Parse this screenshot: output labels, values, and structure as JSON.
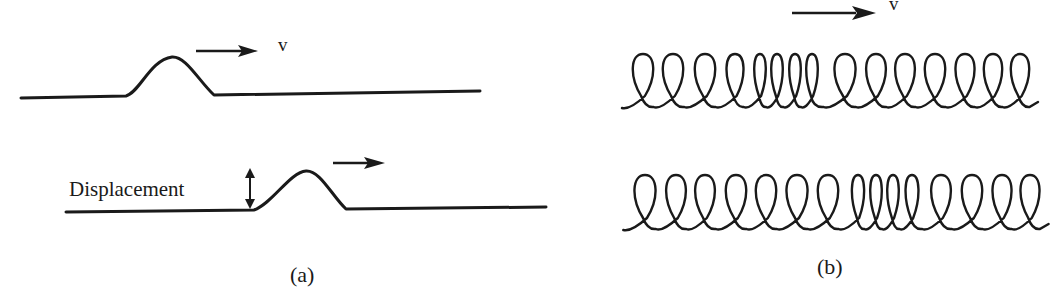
{
  "panels": [
    {
      "id": "a",
      "caption": "(a)",
      "title": "Transverse pulse on a string",
      "top_string": {
        "velocity_label": "v"
      },
      "bottom_string": {
        "displacement_label": "Displacement"
      }
    },
    {
      "id": "b",
      "caption": "(b)",
      "title": "Longitudinal pulse on a spring",
      "top_spring": {
        "velocity_label": "v",
        "loop_centers_x": [
          643,
          673,
          705,
          735,
          760,
          777,
          795,
          812,
          845,
          876,
          905,
          935,
          965,
          993,
          1020
        ],
        "baseline_y": 106,
        "top_y": 54
      },
      "bottom_spring": {
        "loop_centers_x": [
          645,
          676,
          705,
          736,
          766,
          797,
          828,
          858,
          876,
          893,
          912,
          941,
          972,
          1002,
          1030
        ],
        "baseline_y": 228,
        "top_y": 175
      }
    }
  ],
  "colors": {
    "ink": "#1a1a1a",
    "background": "#ffffff"
  }
}
